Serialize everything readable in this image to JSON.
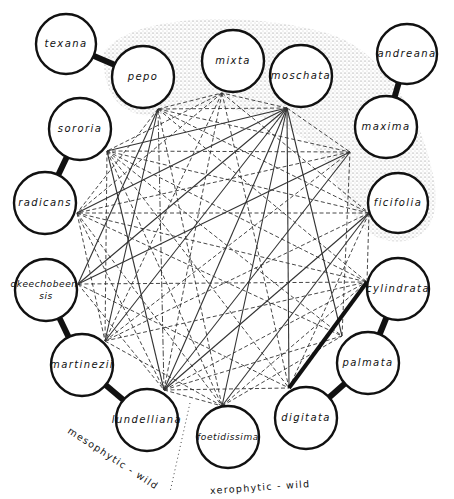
{
  "diagram": {
    "type": "species crossing-relationship diagram",
    "nodes": [
      {
        "id": "texana",
        "label": "texana",
        "x": 66,
        "y": 44,
        "r": 30
      },
      {
        "id": "pepo",
        "label": "pepo",
        "x": 143,
        "y": 77,
        "r": 31
      },
      {
        "id": "mixta",
        "label": "mixta",
        "x": 233,
        "y": 61,
        "r": 31
      },
      {
        "id": "moschata",
        "label": "moschata",
        "x": 301,
        "y": 76,
        "r": 31
      },
      {
        "id": "andreana",
        "label": "andreana",
        "x": 407,
        "y": 54,
        "r": 30
      },
      {
        "id": "maxima",
        "label": "maxima",
        "x": 386,
        "y": 127,
        "r": 31
      },
      {
        "id": "ficifolia",
        "label": "ficifolia",
        "x": 398,
        "y": 203,
        "r": 30
      },
      {
        "id": "sororia",
        "label": "sororia",
        "x": 80,
        "y": 129,
        "r": 31
      },
      {
        "id": "radicans",
        "label": "radicans",
        "x": 45,
        "y": 203,
        "r": 31
      },
      {
        "id": "okeechobeensis",
        "label": "okeechobeen-\nsis",
        "x": 46,
        "y": 290,
        "r": 31
      },
      {
        "id": "martinezii",
        "label": "martinezii",
        "x": 82,
        "y": 365,
        "r": 31
      },
      {
        "id": "lundelliana",
        "label": "lundelliana",
        "x": 147,
        "y": 420,
        "r": 31
      },
      {
        "id": "foetidissima",
        "label": "foetidissima",
        "x": 228,
        "y": 437,
        "r": 31
      },
      {
        "id": "digitata",
        "label": "digitata",
        "x": 306,
        "y": 418,
        "r": 31
      },
      {
        "id": "palmata",
        "label": "palmata",
        "x": 368,
        "y": 363,
        "r": 31
      },
      {
        "id": "cylindrata",
        "label": "cylindrata",
        "x": 398,
        "y": 289,
        "r": 31
      }
    ],
    "hubs": {
      "pepo": [
        158,
        109
      ],
      "mixta": [
        222,
        93
      ],
      "moschata": [
        287,
        108
      ],
      "maxima": [
        350,
        152
      ],
      "ficifolia": [
        369,
        213
      ],
      "sororia": [
        107,
        151
      ],
      "radicans": [
        77,
        213
      ],
      "okeechobeensis": [
        78,
        284
      ],
      "martinezii": [
        105,
        341
      ],
      "lundelliana": [
        164,
        390
      ],
      "foetidissima": [
        222,
        406
      ],
      "digitata": [
        289,
        388
      ],
      "palmata": [
        342,
        336
      ],
      "cylindrata": [
        367,
        282
      ]
    },
    "thick_links": [
      [
        "texana",
        "pepo"
      ],
      [
        "andreana",
        "maxima"
      ],
      [
        "sororia",
        "radicans"
      ],
      [
        "okeechobeensis",
        "martinezii"
      ],
      [
        "martinezii",
        "lundelliana"
      ],
      [
        "digitata",
        "palmata"
      ],
      [
        "palmata",
        "cylindrata"
      ],
      [
        "digitata",
        "cylindrata"
      ]
    ],
    "edges": [
      {
        "from": "moschata",
        "to": "pepo",
        "style": "dashed"
      },
      {
        "from": "moschata",
        "to": "sororia",
        "style": "solid"
      },
      {
        "from": "moschata",
        "to": "radicans",
        "style": "solid"
      },
      {
        "from": "moschata",
        "to": "okeechobeensis",
        "style": "solid"
      },
      {
        "from": "moschata",
        "to": "martinezii",
        "style": "solid"
      },
      {
        "from": "moschata",
        "to": "lundelliana",
        "style": "solid"
      },
      {
        "from": "moschata",
        "to": "foetidissima",
        "style": "solid"
      },
      {
        "from": "moschata",
        "to": "digitata",
        "style": "solid"
      },
      {
        "from": "moschata",
        "to": "palmata",
        "style": "solid"
      },
      {
        "from": "moschata",
        "to": "mixta",
        "style": "dashed"
      },
      {
        "from": "moschata",
        "to": "maxima",
        "style": "dashed"
      },
      {
        "from": "pepo",
        "to": "mixta",
        "style": "dashed"
      },
      {
        "from": "pepo",
        "to": "maxima",
        "style": "dashed"
      },
      {
        "from": "pepo",
        "to": "ficifolia",
        "style": "dashed"
      },
      {
        "from": "pepo",
        "to": "radicans",
        "style": "dashed"
      },
      {
        "from": "pepo",
        "to": "okeechobeensis",
        "style": "solid"
      },
      {
        "from": "pepo",
        "to": "martinezii",
        "style": "solid"
      },
      {
        "from": "pepo",
        "to": "lundelliana",
        "style": "dashdot"
      },
      {
        "from": "pepo",
        "to": "foetidissima",
        "style": "dashed"
      },
      {
        "from": "pepo",
        "to": "cylindrata",
        "style": "dashed"
      },
      {
        "from": "mixta",
        "to": "sororia",
        "style": "dashed"
      },
      {
        "from": "mixta",
        "to": "radicans",
        "style": "dashed"
      },
      {
        "from": "mixta",
        "to": "martinezii",
        "style": "dashed"
      },
      {
        "from": "mixta",
        "to": "lundelliana",
        "style": "dashed"
      },
      {
        "from": "mixta",
        "to": "digitata",
        "style": "dashed"
      },
      {
        "from": "mixta",
        "to": "ficifolia",
        "style": "dashed"
      },
      {
        "from": "maxima",
        "to": "sororia",
        "style": "dashed"
      },
      {
        "from": "maxima",
        "to": "radicans",
        "style": "dashed"
      },
      {
        "from": "maxima",
        "to": "lundelliana",
        "style": "solid"
      },
      {
        "from": "maxima",
        "to": "martinezii",
        "style": "dashed"
      },
      {
        "from": "ficifolia",
        "to": "sororia",
        "style": "dashed"
      },
      {
        "from": "ficifolia",
        "to": "radicans",
        "style": "dashed"
      },
      {
        "from": "ficifolia",
        "to": "lundelliana",
        "style": "solid"
      },
      {
        "from": "ficifolia",
        "to": "martinezii",
        "style": "dashed"
      },
      {
        "from": "ficifolia",
        "to": "cylindrata",
        "style": "dashed"
      },
      {
        "from": "sororia",
        "to": "lundelliana",
        "style": "solid"
      },
      {
        "from": "sororia",
        "to": "cylindrata",
        "style": "dashed"
      },
      {
        "from": "sororia",
        "to": "digitata",
        "style": "dashed"
      },
      {
        "from": "sororia",
        "to": "foetidissima",
        "style": "dashed"
      },
      {
        "from": "sororia",
        "to": "martinezii",
        "style": "dashed"
      },
      {
        "from": "sororia",
        "to": "palmata",
        "style": "dashed"
      },
      {
        "from": "radicans",
        "to": "cylindrata",
        "style": "dashed"
      },
      {
        "from": "radicans",
        "to": "palmata",
        "style": "dashed"
      },
      {
        "from": "radicans",
        "to": "foetidissima",
        "style": "dashed"
      },
      {
        "from": "radicans",
        "to": "lundelliana",
        "style": "dashed"
      },
      {
        "from": "radicans",
        "to": "martinezii",
        "style": "dashed"
      },
      {
        "from": "okeechobeensis",
        "to": "cylindrata",
        "style": "dashed"
      },
      {
        "from": "okeechobeensis",
        "to": "digitata",
        "style": "dashed"
      },
      {
        "from": "okeechobeensis",
        "to": "lundelliana",
        "style": "dashed"
      },
      {
        "from": "okeechobeensis",
        "to": "maxima",
        "style": "solid"
      },
      {
        "from": "martinezii",
        "to": "cylindrata",
        "style": "dashed"
      },
      {
        "from": "martinezii",
        "to": "foetidissima",
        "style": "dashed"
      },
      {
        "from": "lundelliana",
        "to": "cylindrata",
        "style": "dashed"
      },
      {
        "from": "lundelliana",
        "to": "palmata",
        "style": "dashed"
      },
      {
        "from": "lundelliana",
        "to": "digitata",
        "style": "dashed"
      },
      {
        "from": "lundelliana",
        "to": "foetidissima",
        "style": "dashed"
      },
      {
        "from": "foetidissima",
        "to": "cylindrata",
        "style": "dashed"
      },
      {
        "from": "foetidissima",
        "to": "palmata",
        "style": "dashed"
      },
      {
        "from": "foetidissima",
        "to": "ficifolia",
        "style": "solid"
      },
      {
        "from": "digitata",
        "to": "ficifolia",
        "style": "dashed"
      },
      {
        "from": "palmata",
        "to": "maxima",
        "style": "dashed"
      }
    ],
    "shaded_region": {
      "label": "cultivated species",
      "path": "M 104 52 C 130 14, 250 10, 330 34 C 380 50, 420 110, 432 170 C 446 225, 420 248, 385 240 C 355 232, 345 200, 330 170 C 300 110, 200 100, 175 110 C 140 125, 100 110, 104 52 Z",
      "color": "#c9c9c9"
    },
    "divider": {
      "x1": 190,
      "y1": 403,
      "x2": 170,
      "y2": 492,
      "style": "dotted"
    },
    "region_labels": {
      "mesophytic": {
        "text": "mesophytic - wild",
        "x": 69,
        "y": 424,
        "rotate": 33
      },
      "xerophytic": {
        "text": "xerophytic - wild",
        "x": 210,
        "y": 485,
        "rotate": -4
      }
    },
    "colors": {
      "ink": "#111111",
      "edge": "#333333",
      "shade": "#c9c9c9"
    }
  }
}
